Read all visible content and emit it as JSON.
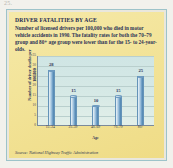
{
  "page": {
    "number_label": "25."
  },
  "figure": {
    "title": "DRIVER FATALITIES BY AGE",
    "caption": "Number of licensed drivers per 100,000 who died in motor vehicle accidents in 1990. The fatality rates for both the 70–79 group and 80+ age group were lower than for the 15- to 24-year-olds.",
    "source": "Source: National Highway Traffic Administration"
  },
  "colors": {
    "page_background": "#f2f1ec",
    "figure_background": "#f3e49a",
    "figure_border": "#9dc3c9",
    "plot_background": "#d6e9e6",
    "bar_fill": "#9dc0dc",
    "bar_edge": "#4d82ae",
    "text": "#2a3256"
  },
  "chart_data": {
    "type": "bar",
    "title": "DRIVER FATALITIES BY AGE",
    "subtitle": "Number of licensed drivers per 100,000 who died in motor vehicle accidents in 1990.",
    "xlabel": "Age",
    "ylabel": "Number of driver deaths per 100,000",
    "categories": [
      "15–24",
      "25–39",
      "40–69",
      "70–79",
      "80+"
    ],
    "values": [
      28,
      15,
      10,
      15,
      25
    ],
    "data_labels": [
      "28",
      "15",
      "10",
      "15",
      "25"
    ],
    "ylim": [
      0,
      35
    ],
    "yticks": [
      0,
      5,
      10,
      15,
      20,
      25,
      30,
      35
    ],
    "ytick_labels": [
      "0",
      "5",
      "10",
      "15",
      "20",
      "25",
      "30",
      "35"
    ],
    "grid": true,
    "legend": false,
    "legend_position": "none"
  }
}
